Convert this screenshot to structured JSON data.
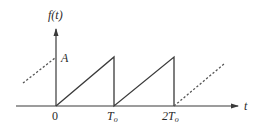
{
  "figure": {
    "type": "sawtooth waveform",
    "y_axis_label": "f(t)",
    "x_axis_label": "t",
    "amplitude_label": "A",
    "tick_labels": [
      "0",
      "T",
      "2T"
    ],
    "tick_subscripts": [
      "",
      "o",
      "o"
    ],
    "colors": {
      "line": "#3a3a3a",
      "text": "#2a2a2a",
      "background": "#ffffff"
    }
  },
  "chart_data": {
    "type": "line",
    "title": "",
    "xlabel": "t",
    "ylabel": "f(t)",
    "x_ticks": [
      "0",
      "T_o",
      "2T_o"
    ],
    "y_ticks": [
      "A"
    ],
    "series": [
      {
        "name": "f(t) solid",
        "style": "solid",
        "points": [
          [
            0,
            0
          ],
          [
            1,
            1
          ],
          [
            1,
            0
          ],
          [
            2,
            1
          ],
          [
            2,
            0
          ]
        ]
      },
      {
        "name": "f(t) before 0",
        "style": "dashed",
        "points": [
          [
            -0.6,
            0.4
          ],
          [
            0,
            1
          ]
        ]
      },
      {
        "name": "f(t) after 2T_o",
        "style": "dashed",
        "points": [
          [
            2,
            0
          ],
          [
            2.8,
            0.8
          ]
        ]
      }
    ],
    "x_unit": "T_o",
    "y_unit": "A",
    "grid": false,
    "legend": null
  }
}
